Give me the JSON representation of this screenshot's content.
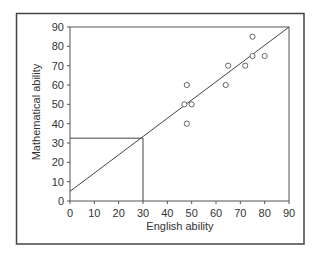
{
  "chart_data": {
    "type": "scatter",
    "title": "",
    "xlabel": "English ability",
    "ylabel": "Mathematical ability",
    "xlim": [
      0,
      90
    ],
    "ylim": [
      0,
      90
    ],
    "x_ticks": [
      0,
      10,
      20,
      30,
      40,
      50,
      60,
      70,
      80,
      90
    ],
    "y_ticks": [
      0,
      10,
      20,
      30,
      40,
      50,
      60,
      70,
      80,
      90
    ],
    "grid": false,
    "legend": null,
    "series": [
      {
        "name": "observations",
        "marker": "open-circle",
        "points": [
          {
            "x": 48,
            "y": 60
          },
          {
            "x": 47,
            "y": 50
          },
          {
            "x": 50,
            "y": 50
          },
          {
            "x": 48,
            "y": 40
          },
          {
            "x": 64,
            "y": 60
          },
          {
            "x": 65,
            "y": 70
          },
          {
            "x": 72,
            "y": 70
          },
          {
            "x": 75,
            "y": 75
          },
          {
            "x": 80,
            "y": 75
          },
          {
            "x": 75,
            "y": 85
          }
        ]
      }
    ],
    "regression_line": {
      "x1": 0,
      "y1": 5,
      "x2": 90,
      "y2": 90
    },
    "annotation_guides": {
      "description": "Read-off of predicted value at English ability 30",
      "x": 30,
      "y": 32.5
    }
  },
  "colors": {
    "axis": "#555555",
    "line": "#444444",
    "marker": "#555555",
    "frame": "#444444",
    "text": "#333333"
  }
}
